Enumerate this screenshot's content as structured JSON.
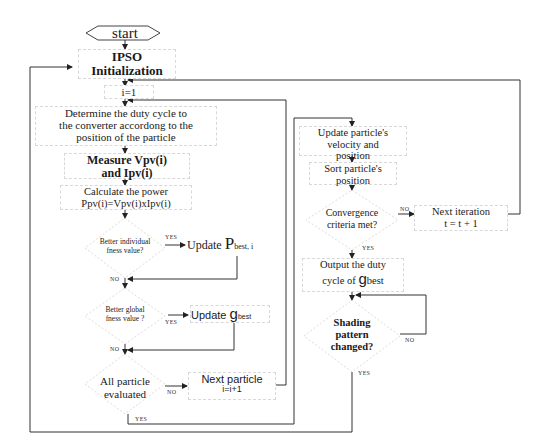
{
  "diagram": {
    "type": "flowchart",
    "nodes": {
      "start": "start",
      "init_1": "IPSO",
      "init_2": "Initialization",
      "i_init": "i=1",
      "duty_1": "Determine the duty cycle to",
      "duty_2": "the converter accordong to the",
      "duty_3": "position of the particle",
      "measure_1": "Measure Vpv(i)",
      "measure_2": "and Ipv(i)",
      "calc_1": "Calculate the power",
      "calc_2": "Ppv(i)=Vpv(i)xIpv(i)",
      "dec_individual_1": "Better individual",
      "dec_individual_2": "fness value?",
      "update_pbest_prefix": "Update ",
      "update_pbest_main": "P",
      "update_pbest_sub": "best, i",
      "dec_global_1": "Better global",
      "dec_global_2": "fness value ?",
      "update_gbest_prefix": "Update ",
      "update_gbest_main": "g",
      "update_gbest_sub": "best",
      "dec_all_1": "All particle",
      "dec_all_2": "evaluated",
      "next_particle_1": "Next particle",
      "next_particle_2": "i=i+1",
      "update_vel_1": "Update particle's",
      "update_vel_2": "velocity and",
      "update_vel_3": "position",
      "sort_1": "Sort particle's",
      "sort_2": "position",
      "dec_conv_1": "Convergence",
      "dec_conv_2": "criteria met?",
      "next_iter_1": "Next iteration",
      "next_iter_2": "t = t + 1",
      "output_1": "Output the duty",
      "output_2_prefix": "cycle of ",
      "output_2_main": "g",
      "output_2_sub": "best",
      "dec_shading_1": "Shading",
      "dec_shading_2": "pattern",
      "dec_shading_3": "changed?"
    },
    "edge_labels": {
      "individual_yes": "YES",
      "individual_no": "NO",
      "global_yes": "YES",
      "global_no": "NO",
      "all_no": "NO",
      "all_yes": "YES",
      "conv_no": "NO",
      "conv_yes": "YES",
      "shading_no": "NO",
      "shading_yes": "YES"
    }
  }
}
